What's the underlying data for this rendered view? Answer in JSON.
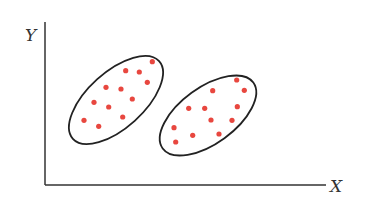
{
  "diagram": {
    "type": "scatter-clusters",
    "axes": {
      "x_label": "X",
      "y_label": "Y",
      "origin": [
        45,
        185
      ],
      "x_end": 326,
      "y_top": 22,
      "color": "#333333"
    },
    "point_color": "#e8473f",
    "outline_color": "#222222",
    "clusters": [
      {
        "name": "cluster-left",
        "ellipse": {
          "cx": 116,
          "cy": 100,
          "rx": 58,
          "ry": 28,
          "rotate": -42
        },
        "points": [
          [
            152.3,
            61.7
          ],
          [
            125.7,
            70.7
          ],
          [
            139.3,
            72
          ],
          [
            147.3,
            82.3
          ],
          [
            106,
            87.3
          ],
          [
            121,
            89
          ],
          [
            132.3,
            99
          ],
          [
            94,
            102.3
          ],
          [
            108.7,
            107
          ],
          [
            122.7,
            117
          ],
          [
            84,
            120.3
          ],
          [
            98.7,
            126.3
          ]
        ]
      },
      {
        "name": "cluster-right",
        "ellipse": {
          "cx": 208,
          "cy": 115.5,
          "rx": 56,
          "ry": 28,
          "rotate": -36
        },
        "points": [
          [
            236.7,
            80
          ],
          [
            212.7,
            90.7
          ],
          [
            244.3,
            90.3
          ],
          [
            188.7,
            108.3
          ],
          [
            204.7,
            108.3
          ],
          [
            237.3,
            106.7
          ],
          [
            211,
            120
          ],
          [
            232,
            120.3
          ],
          [
            174,
            127.7
          ],
          [
            192.7,
            135.3
          ],
          [
            219,
            134
          ],
          [
            175.7,
            142
          ]
        ]
      }
    ]
  }
}
